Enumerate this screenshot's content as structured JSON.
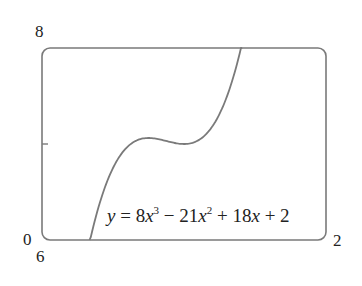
{
  "chart_data": {
    "type": "line",
    "title": "",
    "function": "y = 8x^3 - 21x^2 + 18x + 2",
    "annotation": "y = 8x³ − 21x² + 18x + 2",
    "xlim": [
      0,
      2
    ],
    "ylim": [
      6,
      8
    ],
    "xlabel": "",
    "ylabel": "",
    "tick_labels": {
      "x_min": "0",
      "x_max": "2",
      "y_min": "6",
      "y_max": "8"
    },
    "y_ticks": [
      7
    ],
    "grid": false,
    "frame": "rounded-rectangle",
    "series": [
      {
        "name": "y = 8x^3 - 21x^2 + 18x + 2",
        "x": [
          0.335,
          0.4,
          0.5,
          0.6,
          0.7,
          0.75,
          0.8,
          0.9,
          1.0,
          1.1,
          1.2,
          1.3,
          1.41
        ],
        "y": [
          6.0,
          6.352,
          6.75,
          6.968,
          7.054,
          7.0625,
          7.056,
          7.022,
          7.0,
          7.028,
          7.144,
          7.386,
          8.0
        ]
      }
    ],
    "critical_points": {
      "local_max": [
        0.75,
        7.0625
      ],
      "local_min": [
        1.0,
        7.0
      ]
    },
    "colors": {
      "curve": "#7a7a7a",
      "frame": "#7a7a7a",
      "text": "#222222"
    }
  },
  "labels": {
    "x_min": "0",
    "x_max": "2",
    "y_min": "6",
    "y_max": "8"
  },
  "equation": {
    "y": "y",
    "eq": " = 8",
    "x1": "x",
    "p3": "3",
    "minus": " − 21",
    "x2": "x",
    "p2": "2",
    "plus1": " + 18",
    "x3": "x",
    "plus2": " + 2"
  }
}
